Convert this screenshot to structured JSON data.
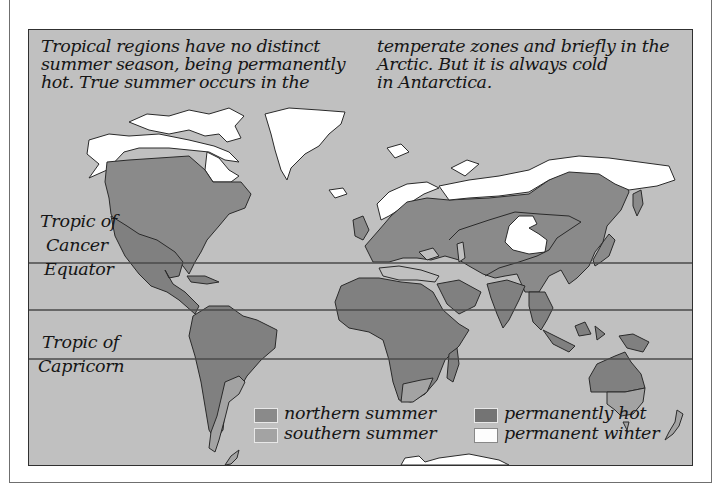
{
  "caption": {
    "left_lines": [
      "Tropical regions have no distinct",
      "summer season, being permanently",
      "hot. True summer occurs in the"
    ],
    "right_lines": [
      "temperate zones and briefly in the",
      "Arctic. But it is always cold",
      "in Antarctica."
    ]
  },
  "latitude_lines": {
    "tropic_of_cancer": {
      "line1": "Tropic of",
      "line2": "Cancer"
    },
    "equator": {
      "label": "Equator"
    },
    "tropic_of_capricorn": {
      "line1": "Tropic of",
      "line2": "Capricorn"
    }
  },
  "legend": {
    "items": [
      {
        "label": "northern summer",
        "color": "#8a8a8a"
      },
      {
        "label": "southern summer",
        "color": "#a3a3a3"
      },
      {
        "label": "permanently hot",
        "color": "#747474"
      },
      {
        "label": "permanent winter",
        "color": "#ffffff"
      }
    ]
  },
  "colors": {
    "ocean": "#c0c0c0",
    "northern_summer": "#8a8a8a",
    "southern_summer": "#a3a3a3",
    "permanently_hot": "#808080",
    "permanent_winter": "#ffffff",
    "coastline": "#2a2a2a"
  }
}
